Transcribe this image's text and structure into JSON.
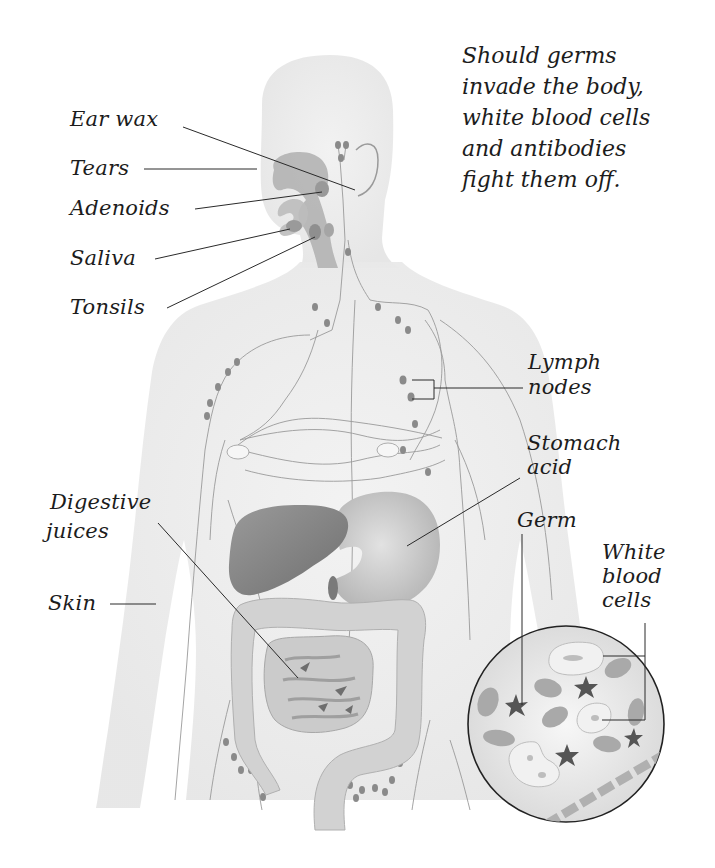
{
  "caption": {
    "lines": [
      "Should germs",
      "invade the body,",
      "white blood cells",
      "and antibodies",
      "fight them off."
    ]
  },
  "labels": {
    "ear_wax": "Ear wax",
    "tears": "Tears",
    "adenoids": "Adenoids",
    "saliva": "Saliva",
    "tonsils": "Tonsils",
    "lymph_nodes_1": "Lymph",
    "lymph_nodes_2": "nodes",
    "stomach_acid_1": "Stomach",
    "stomach_acid_2": "acid",
    "digestive_juices_1": "Digestive",
    "digestive_juices_2": "juices",
    "germ": "Germ",
    "white_blood_cells_1": "White",
    "white_blood_cells_2": "blood",
    "white_blood_cells_3": "cells",
    "skin": "Skin"
  },
  "colors": {
    "body": "#ececec",
    "organ_dark": "#8e8e8e",
    "organ_mid": "#c4c4c4",
    "lymph": "#8a8a8a",
    "line": "#2a2a2a"
  }
}
